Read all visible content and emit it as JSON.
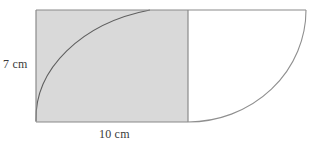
{
  "figure": {
    "kind": "composite-geometry-diagram",
    "labels": {
      "height": "7 cm",
      "width": "10 cm"
    },
    "colors": {
      "shade_fill": "#d9d9d9",
      "outline": "#8a8a8a",
      "arc_stroke": "#6e6e6e",
      "background": "#ffffff",
      "text": "#3a3a3a"
    },
    "geometry": {
      "rect": {
        "x": 36,
        "y": 10,
        "width": 152,
        "height": 112
      },
      "inner_arc": {
        "from_x": 36,
        "from_y": 121,
        "to_x": 150,
        "to_y": 10,
        "rx": 152,
        "ry": 112,
        "sweep": 1,
        "large_arc": 0
      },
      "outer_arc": {
        "from_x": 306,
        "from_y": 10,
        "to_x": 188,
        "to_y": 122,
        "rx": 118,
        "ry": 112,
        "sweep": 1,
        "large_arc": 0
      },
      "top_edge": {
        "x1": 36,
        "y1": 10,
        "x2": 306,
        "y2": 10
      }
    }
  }
}
